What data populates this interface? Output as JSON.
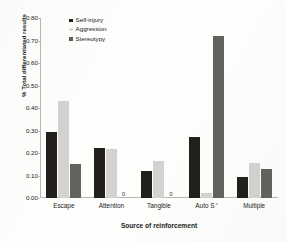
{
  "chart_data": {
    "type": "bar",
    "title": "",
    "subtitle": "",
    "xlabel": "Source of reinforcement",
    "ylabel": "% Total differentiated results",
    "categories": [
      "Escape",
      "Attention",
      "Tangible",
      "Auto S",
      "Multiple"
    ],
    "category_superscripts": [
      "",
      "",
      "",
      "r",
      ""
    ],
    "series": [
      {
        "name": "Self-injury",
        "color": "#231f1d",
        "values": [
          0.295,
          0.222,
          0.121,
          0.271,
          0.095
        ]
      },
      {
        "name": "Aggression",
        "color": "#d2d2d0",
        "values": [
          0.432,
          0.218,
          0.165,
          0.021,
          0.157
        ]
      },
      {
        "name": "Stereotypy",
        "color": "#63625c",
        "values": [
          0.152,
          0.0,
          0.0,
          0.719,
          0.131
        ]
      }
    ],
    "zero_labels": [
      {
        "category": "Attention",
        "series": "Stereotypy",
        "text": "0"
      },
      {
        "category": "Tangible",
        "series": "Stereotypy",
        "text": "0"
      }
    ],
    "ylim": [
      0.0,
      0.8
    ],
    "ytick_labels": [
      "0.00",
      "0.10",
      "0.20",
      "0.30",
      "0.40",
      "0.50",
      "0.60",
      "0.70",
      "0.80"
    ],
    "ytick_values": [
      0.0,
      0.1,
      0.2,
      0.3,
      0.4,
      0.5,
      0.6,
      0.7,
      0.8
    ],
    "grid": false,
    "legend_position": "top-left-inside"
  },
  "legend": {
    "items": [
      {
        "label": "Self-injury",
        "swatch": "legend-swatch-self-injury"
      },
      {
        "label": "Aggression",
        "swatch": "legend-swatch-aggression"
      },
      {
        "label": "Stereotypy",
        "swatch": "legend-swatch-stereotypy"
      }
    ]
  }
}
